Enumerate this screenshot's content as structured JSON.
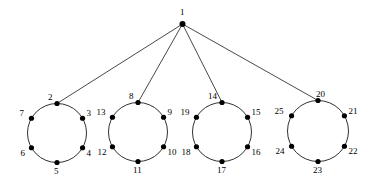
{
  "figure": {
    "type": "graph-diagram",
    "title": "",
    "background_color": "#ffffff",
    "stroke_color": "#1a1a1a",
    "node_fill_color": "#000000",
    "node_radius": 2.6,
    "edge_width": 0.8,
    "circle_stroke_width": 0.9,
    "label_font_size": 9
  },
  "root": {
    "id": "1",
    "label": "1",
    "x": 182.5,
    "y": 24,
    "label_x": 180,
    "label_y": 8
  },
  "clusters": [
    {
      "name": "cluster-1",
      "cx": 57,
      "cy": 133,
      "r": 29.5,
      "nodes": [
        {
          "label": "2",
          "angle": -90,
          "label_dx": -9,
          "label_dy": -11
        },
        {
          "label": "3",
          "angle": -30,
          "label_dx": 4,
          "label_dy": -9
        },
        {
          "label": "4",
          "angle": 30,
          "label_dx": 4,
          "label_dy": 1
        },
        {
          "label": "5",
          "angle": 90,
          "label_dx": -3,
          "label_dy": 4
        },
        {
          "label": "6",
          "angle": 150,
          "label_dx": -11,
          "label_dy": 1
        },
        {
          "label": "7",
          "angle": 210,
          "label_dx": -12,
          "label_dy": -9
        }
      ]
    },
    {
      "name": "cluster-2",
      "cx": 138,
      "cy": 132,
      "r": 29.5,
      "nodes": [
        {
          "label": "8",
          "angle": -90,
          "label_dx": -9,
          "label_dy": -11
        },
        {
          "label": "9",
          "angle": -30,
          "label_dx": 4,
          "label_dy": -9
        },
        {
          "label": "10",
          "angle": 30,
          "label_dx": 4,
          "label_dy": 1
        },
        {
          "label": "11",
          "angle": 90,
          "label_dx": -5,
          "label_dy": 4
        },
        {
          "label": "12",
          "angle": 150,
          "label_dx": -15,
          "label_dy": 1
        },
        {
          "label": "13",
          "angle": 210,
          "label_dx": -16,
          "label_dy": -9
        }
      ]
    },
    {
      "name": "cluster-3",
      "cx": 222,
      "cy": 132,
      "r": 29.5,
      "nodes": [
        {
          "label": "14",
          "angle": -90,
          "label_dx": -14,
          "label_dy": -11
        },
        {
          "label": "15",
          "angle": -30,
          "label_dx": 4,
          "label_dy": -9
        },
        {
          "label": "16",
          "angle": 30,
          "label_dx": 4,
          "label_dy": 1
        },
        {
          "label": "17",
          "angle": 90,
          "label_dx": -5,
          "label_dy": 4
        },
        {
          "label": "18",
          "angle": 150,
          "label_dx": -15,
          "label_dy": 1
        },
        {
          "label": "19",
          "angle": 210,
          "label_dx": -16,
          "label_dy": -9
        }
      ]
    },
    {
      "name": "cluster-4",
      "cx": 318,
      "cy": 131,
      "r": 30.5,
      "nodes": [
        {
          "label": "20",
          "angle": -90,
          "label_dx": -2,
          "label_dy": -11
        },
        {
          "label": "21",
          "angle": -30,
          "label_dx": 4,
          "label_dy": -9
        },
        {
          "label": "22",
          "angle": 30,
          "label_dx": 4,
          "label_dy": 1
        },
        {
          "label": "23",
          "angle": 90,
          "label_dx": -5,
          "label_dy": 4
        },
        {
          "label": "24",
          "angle": 150,
          "label_dx": -16,
          "label_dy": 1
        },
        {
          "label": "25",
          "angle": 210,
          "label_dx": -17,
          "label_dy": -9
        }
      ]
    }
  ],
  "edges": [
    {
      "from": "1",
      "to": "2"
    },
    {
      "from": "1",
      "to": "8"
    },
    {
      "from": "1",
      "to": "14"
    },
    {
      "from": "1",
      "to": "20"
    }
  ]
}
